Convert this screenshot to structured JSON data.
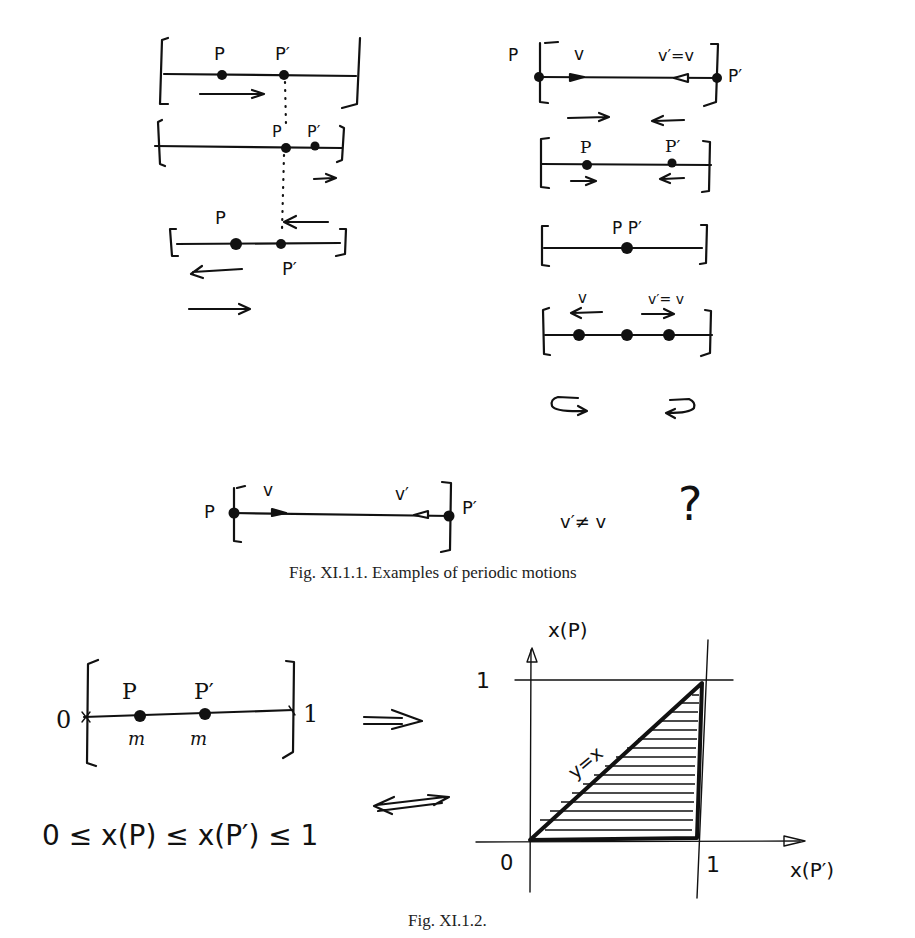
{
  "figure1": {
    "caption": "Fig. XI.1.1. Examples of periodic motions",
    "left_column": {
      "diagram1": {
        "label_p": "P",
        "label_p_prime": "P′"
      },
      "diagram2": {
        "label_p": "P",
        "label_p_prime": "P′"
      },
      "diagram3": {
        "label_p": "P",
        "label_p_prime": "P′"
      }
    },
    "right_column": {
      "diagram1": {
        "label_p": "P",
        "label_p_prime": "P′",
        "label_v": "v",
        "label_v_prime": "v′=v"
      },
      "diagram2": {
        "label_p": "P",
        "label_p_prime": "P′"
      },
      "diagram3": {
        "label_pp": "P P′"
      },
      "diagram4": {
        "label_v": "v",
        "label_v_prime": "v′= v"
      }
    },
    "bottom": {
      "label_p": "P",
      "label_p_prime": "P′",
      "label_v": "v",
      "label_v_prime": "v′",
      "inequality": "v′≠ v",
      "question_mark": "?"
    }
  },
  "figure2": {
    "caption": "Fig. XI.1.2.",
    "segment": {
      "label_zero": "0",
      "label_one": "1",
      "label_p": "P",
      "label_p_prime": "P′",
      "mass_label_1": "m",
      "mass_label_2": "m"
    },
    "condition": "0 ≤ x(P) ≤ x(P′) ≤ 1",
    "plot": {
      "y_axis_label": "x(P)",
      "x_axis_label": "x(P′)",
      "origin_label": "0",
      "x_tick_label": "1",
      "y_tick_label": "1",
      "diagonal_label": "y=x"
    }
  }
}
